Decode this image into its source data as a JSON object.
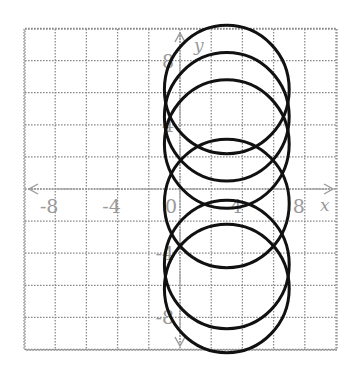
{
  "chart_data": {
    "type": "scatter",
    "title": "",
    "xlabel": "x",
    "ylabel": "y",
    "xlim": [
      -10,
      10
    ],
    "ylim": [
      -10,
      10
    ],
    "grid": true,
    "grid_step": 2,
    "x_tick_labels": [
      {
        "value": -8,
        "label": "-8"
      },
      {
        "value": -4,
        "label": "-4"
      },
      {
        "value": 0,
        "label": "0"
      },
      {
        "value": 4,
        "label": "4"
      },
      {
        "value": 8,
        "label": "8"
      }
    ],
    "y_tick_labels": [
      {
        "value": 8,
        "label": "8"
      },
      {
        "value": 4,
        "label": "4"
      },
      {
        "value": -4,
        "label": "-4"
      },
      {
        "value": -8,
        "label": "-8"
      }
    ],
    "series": [
      {
        "name": "circle-1",
        "shape": "circle",
        "center": [
          3,
          6.2
        ],
        "radius": 4
      },
      {
        "name": "circle-2",
        "shape": "circle",
        "center": [
          3,
          4.5
        ],
        "radius": 4
      },
      {
        "name": "circle-3",
        "shape": "circle",
        "center": [
          3,
          2.8
        ],
        "radius": 4
      },
      {
        "name": "circle-4",
        "shape": "circle",
        "center": [
          3,
          -0.9
        ],
        "radius": 4
      },
      {
        "name": "circle-5",
        "shape": "circle",
        "center": [
          3,
          -4.7
        ],
        "radius": 4
      },
      {
        "name": "circle-6",
        "shape": "circle",
        "center": [
          3,
          -6.2
        ],
        "radius": 4
      }
    ]
  },
  "layout": {
    "plot_left": 25,
    "plot_top": 29,
    "plot_right": 337,
    "plot_bottom": 350,
    "origin_x": 180,
    "origin_y": 189,
    "px_per_unit_x": 15.6,
    "px_per_unit_y": 16.05
  },
  "colors": {
    "grid": "#8a8a8a",
    "axes": "#9a9a9a",
    "curves": "#111111",
    "background": "#ffffff"
  }
}
